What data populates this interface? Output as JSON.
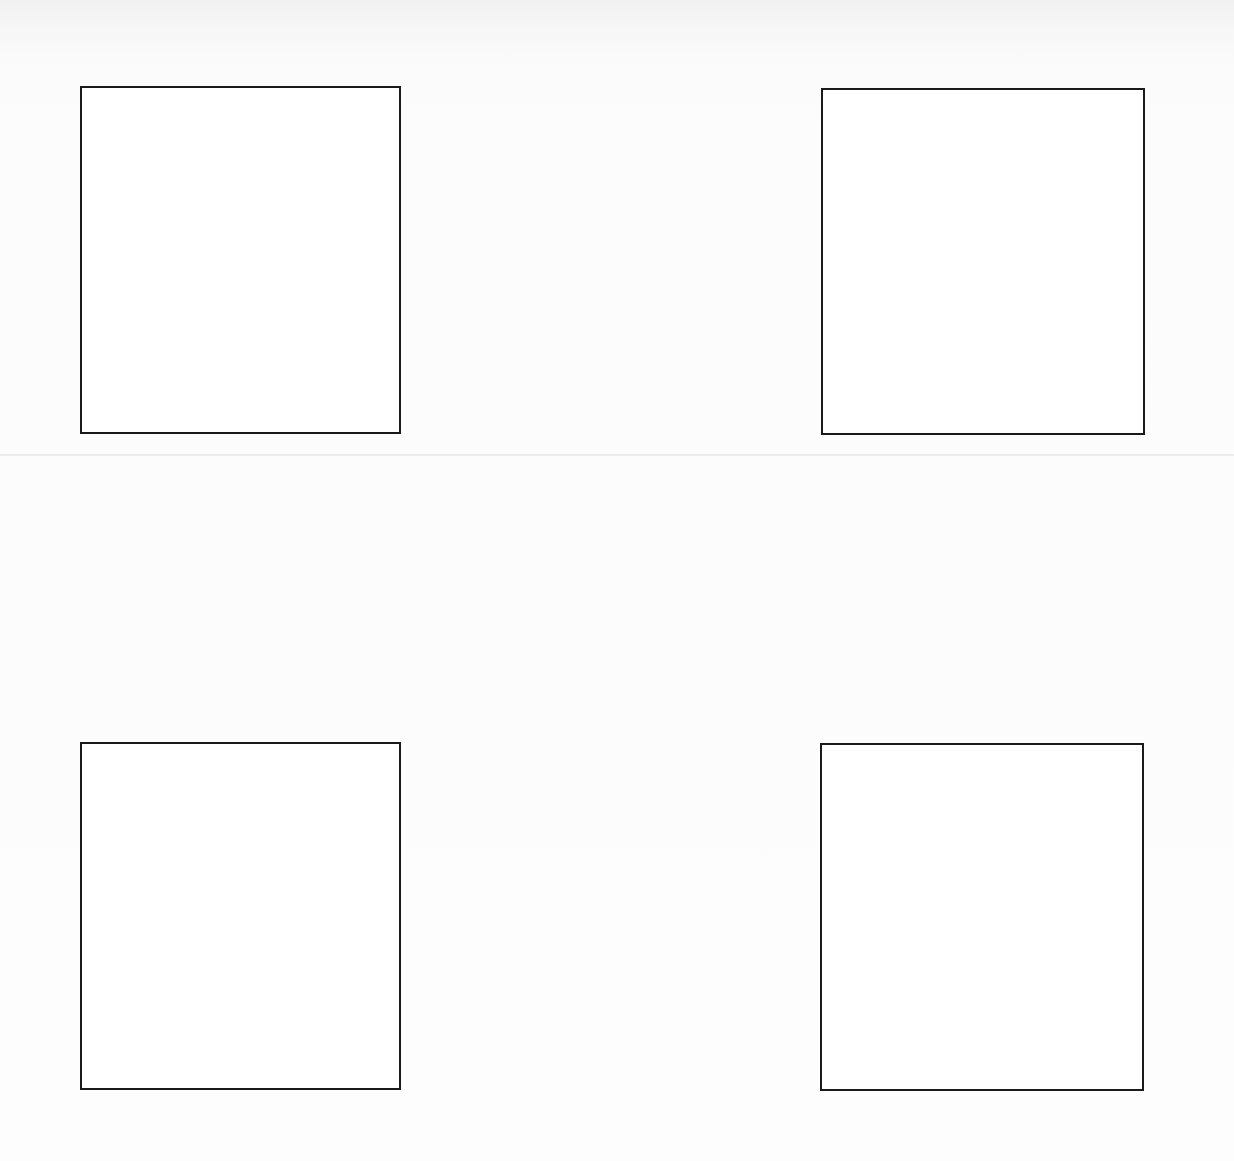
{
  "document": {
    "background": "#fbfbfb",
    "border_color": "#1a1a1a",
    "fold_line": {
      "top": 454,
      "color": "#ececec"
    },
    "boxes": [
      {
        "name": "top-left-box",
        "left": 80,
        "top": 86,
        "width": 321,
        "height": 348
      },
      {
        "name": "top-right-box",
        "left": 821,
        "top": 88,
        "width": 324,
        "height": 347
      },
      {
        "name": "bottom-left-box",
        "left": 80,
        "top": 742,
        "width": 321,
        "height": 348
      },
      {
        "name": "bottom-right-box",
        "left": 820,
        "top": 743,
        "width": 324,
        "height": 348
      }
    ]
  }
}
